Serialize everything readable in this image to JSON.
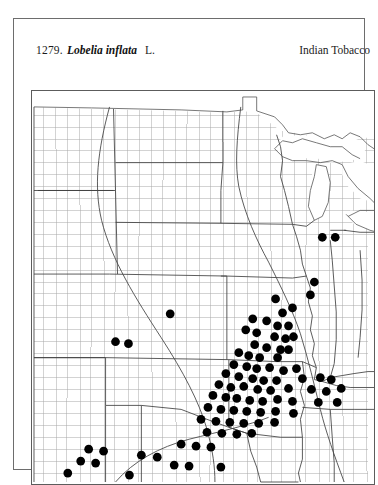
{
  "plate": {
    "number": "1279.",
    "scientific_name": "Lobelia inflata",
    "authority": "L.",
    "common_name": "Indian Tobacco"
  },
  "colors": {
    "page_background": "#ffffff",
    "frame_line": "#6d6d6d",
    "map_border": "#5c5c5c",
    "county_line": "#a0a0a0",
    "state_line": "#3f3f3f",
    "coast_line": "#4a4a4a",
    "range_line": "#4a4a4a",
    "dot_fill": "#000000",
    "text": "#1b1b1b"
  },
  "map": {
    "kind": "county-dot-distribution-map",
    "region": "central and eastern United States",
    "dot_symbol": "filled-circle",
    "dot_radius_px": 4.4,
    "width_px": 344,
    "height_px": 395,
    "occurrence_dots": [
      [
        292.0,
        147.0
      ],
      [
        305.0,
        147.0
      ],
      [
        284.0,
        192.0
      ],
      [
        280.0,
        205.0
      ],
      [
        139.0,
        224.0
      ],
      [
        245.0,
        209.0
      ],
      [
        252.0,
        223.0
      ],
      [
        262.0,
        218.0
      ],
      [
        222.0,
        229.0
      ],
      [
        236.0,
        231.0
      ],
      [
        247.0,
        236.0
      ],
      [
        258.0,
        236.0
      ],
      [
        215.0,
        240.0
      ],
      [
        226.0,
        243.0
      ],
      [
        244.0,
        247.0
      ],
      [
        255.0,
        249.0
      ],
      [
        263.0,
        247.0
      ],
      [
        84.0,
        252.0
      ],
      [
        97.0,
        254.0
      ],
      [
        224.0,
        255.0
      ],
      [
        236.0,
        258.0
      ],
      [
        250.0,
        260.0
      ],
      [
        258.0,
        260.0
      ],
      [
        208.0,
        263.0
      ],
      [
        218.0,
        266.0
      ],
      [
        229.0,
        268.0
      ],
      [
        247.0,
        268.0
      ],
      [
        203.0,
        275.0
      ],
      [
        216.0,
        277.0
      ],
      [
        226.0,
        279.0
      ],
      [
        239.0,
        278.0
      ],
      [
        253.0,
        281.0
      ],
      [
        266.0,
        279.0
      ],
      [
        195.0,
        284.0
      ],
      [
        208.0,
        287.0
      ],
      [
        222.0,
        289.0
      ],
      [
        233.0,
        291.0
      ],
      [
        246.0,
        291.0
      ],
      [
        272.0,
        289.0
      ],
      [
        290.0,
        288.0
      ],
      [
        301.0,
        290.0
      ],
      [
        188.0,
        295.0
      ],
      [
        200.0,
        298.0
      ],
      [
        213.0,
        297.0
      ],
      [
        227.0,
        300.0
      ],
      [
        240.0,
        301.0
      ],
      [
        258.0,
        299.0
      ],
      [
        281.0,
        300.0
      ],
      [
        296.0,
        302.0
      ],
      [
        311.0,
        299.0
      ],
      [
        182.0,
        306.0
      ],
      [
        195.0,
        308.0
      ],
      [
        206.0,
        309.0
      ],
      [
        219.0,
        311.0
      ],
      [
        232.0,
        312.0
      ],
      [
        247.0,
        310.0
      ],
      [
        262.0,
        312.0
      ],
      [
        288.0,
        313.0
      ],
      [
        307.0,
        313.0
      ],
      [
        177.0,
        318.0
      ],
      [
        190.0,
        320.0
      ],
      [
        203.0,
        321.0
      ],
      [
        216.0,
        322.0
      ],
      [
        230.0,
        323.0
      ],
      [
        245.0,
        322.0
      ],
      [
        263.0,
        324.0
      ],
      [
        170.0,
        330.0
      ],
      [
        185.0,
        332.0
      ],
      [
        199.0,
        333.0
      ],
      [
        213.0,
        334.0
      ],
      [
        228.0,
        334.0
      ],
      [
        244.0,
        333.0
      ],
      [
        176.0,
        343.0
      ],
      [
        191.0,
        344.0
      ],
      [
        206.0,
        345.0
      ],
      [
        221.0,
        344.0
      ],
      [
        150.0,
        355.0
      ],
      [
        165.0,
        357.0
      ],
      [
        180.0,
        358.0
      ],
      [
        57.0,
        360.0
      ],
      [
        72.0,
        362.0
      ],
      [
        110.0,
        366.0
      ],
      [
        126.0,
        368.0
      ],
      [
        49.0,
        372.0
      ],
      [
        64.0,
        374.0
      ],
      [
        143.0,
        376.0
      ],
      [
        158.0,
        377.0
      ],
      [
        190.0,
        378.0
      ],
      [
        36.0,
        384.0
      ],
      [
        98.0,
        386.0
      ]
    ]
  }
}
